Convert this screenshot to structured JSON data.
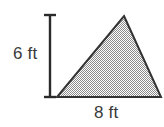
{
  "figure": {
    "kind": "geometry-diagram",
    "shape": "triangle",
    "background_color": "#ffffff",
    "triangle": {
      "name": "shaded-triangle",
      "fill_description": "gray halftone checkerboard shading",
      "fill_color": "#a3a3a3",
      "outline_color": "#333333",
      "outline_width": 2,
      "vertices": {
        "apex": {
          "x": 124,
          "y": 16
        },
        "bottom_left": {
          "x": 57,
          "y": 97
        },
        "bottom_right": {
          "x": 161,
          "y": 97
        }
      }
    },
    "height_dimension": {
      "name": "height-dimension-line",
      "label": "6 ft",
      "value": 6,
      "unit": "ft",
      "orientation": "vertical",
      "line_color": "#2b2b2b",
      "x": 50,
      "y_top": 14,
      "y_bottom": 98,
      "cap_half_width": 6
    },
    "base_dimension": {
      "name": "base-dimension-label",
      "label": "8 ft",
      "value": 8,
      "unit": "ft",
      "orientation": "horizontal"
    }
  }
}
